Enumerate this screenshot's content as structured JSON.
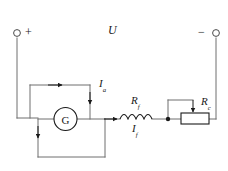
{
  "diagram": {
    "supply": {
      "voltage_label": "U",
      "positive_terminal_sign": "+",
      "negative_terminal_sign": "−"
    },
    "components": {
      "galvanometer": {
        "symbol_letter": "G",
        "name": "galvanometer"
      },
      "field_resistor": {
        "label_main": "R",
        "label_sub": "f",
        "name": "field-winding-inductor"
      },
      "rheostat": {
        "label_main": "R",
        "label_sub": "c",
        "name": "adjustable-rheostat"
      }
    },
    "currents": [
      {
        "label_main": "I",
        "label_sub": "a",
        "name": "armature-current"
      },
      {
        "label_main": "I",
        "label_sub": "f",
        "name": "field-current"
      }
    ],
    "colors": {
      "wire": "#6e6e6e",
      "ink": "#1a1a1a",
      "background": "#ffffff"
    }
  }
}
